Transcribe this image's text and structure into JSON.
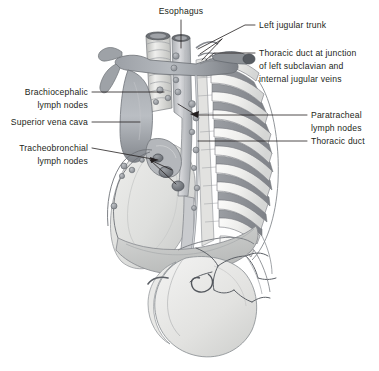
{
  "figure": {
    "background_color": "#ffffff",
    "text_color": "#231f20",
    "leader_color": "#231f20",
    "width": 379,
    "height": 371
  },
  "labels": {
    "esophagus": {
      "text": "Esophagus",
      "x": 196,
      "y": 14,
      "align": "middle"
    },
    "left_jugular_trunk": {
      "text": "Left jugular trunk",
      "x": 259,
      "y": 28,
      "align": "start"
    },
    "thoracic_duct_junction": {
      "lines": [
        "Thoracic duct at junction",
        "of left subclavian and",
        "internal jugular veins"
      ],
      "x": 259,
      "y": 56,
      "align": "start"
    },
    "brachiocephalic_lymph_nodes": {
      "lines": [
        "Brachiocephalic",
        "lymph nodes"
      ],
      "x": 88,
      "y": 95,
      "align": "end"
    },
    "superior_vena_cava": {
      "text": "Superior vena cava",
      "x": 88,
      "y": 125,
      "align": "end"
    },
    "tracheobronchial_lymph_nodes": {
      "lines": [
        "Tracheobronchial",
        "lymph nodes"
      ],
      "x": 88,
      "y": 151,
      "align": "end"
    },
    "paratracheal_lymph_nodes": {
      "lines": [
        "Paratracheal",
        "lymph nodes"
      ],
      "x": 311,
      "y": 118,
      "align": "start"
    },
    "thoracic_duct": {
      "text": "Thoracic duct",
      "x": 311,
      "y": 144,
      "align": "start"
    }
  },
  "palette": {
    "outline": "#5d6067",
    "outline_dark": "#3f434a",
    "vessel_mid": "#8e9298",
    "vessel_dark": "#6e7278",
    "vessel_light": "#b9bdc2",
    "rib_bone": "#f1f1ef",
    "rib_shade": "#cfd1d2",
    "intercostal": "#8d9096",
    "lung_light": "#e8e8e6",
    "lung_mid": "#d6d7d5",
    "lung_shade": "#c2c3c2",
    "stomach_light": "#ececeb",
    "stomach_mid": "#dcdcda",
    "diaphragm": "#c8cac9",
    "node_fill": "#a9acb1",
    "node_dark": "#787c82",
    "trachea_ring": "#e6e6e4"
  },
  "anatomy": {
    "structures": [
      "esophagus",
      "trachea",
      "left-jugular-trunk",
      "thoracic-duct",
      "superior-vena-cava",
      "brachiocephalic-vein",
      "aortic-arch",
      "rib-cage",
      "intercostal-muscles",
      "left-lung",
      "diaphragm",
      "stomach",
      "celiac-trunk",
      "brachiocephalic-lymph-nodes",
      "paratracheal-lymph-nodes",
      "tracheobronchial-lymph-nodes"
    ],
    "rib_count": 11,
    "lymph_node_chain_count": 7
  }
}
